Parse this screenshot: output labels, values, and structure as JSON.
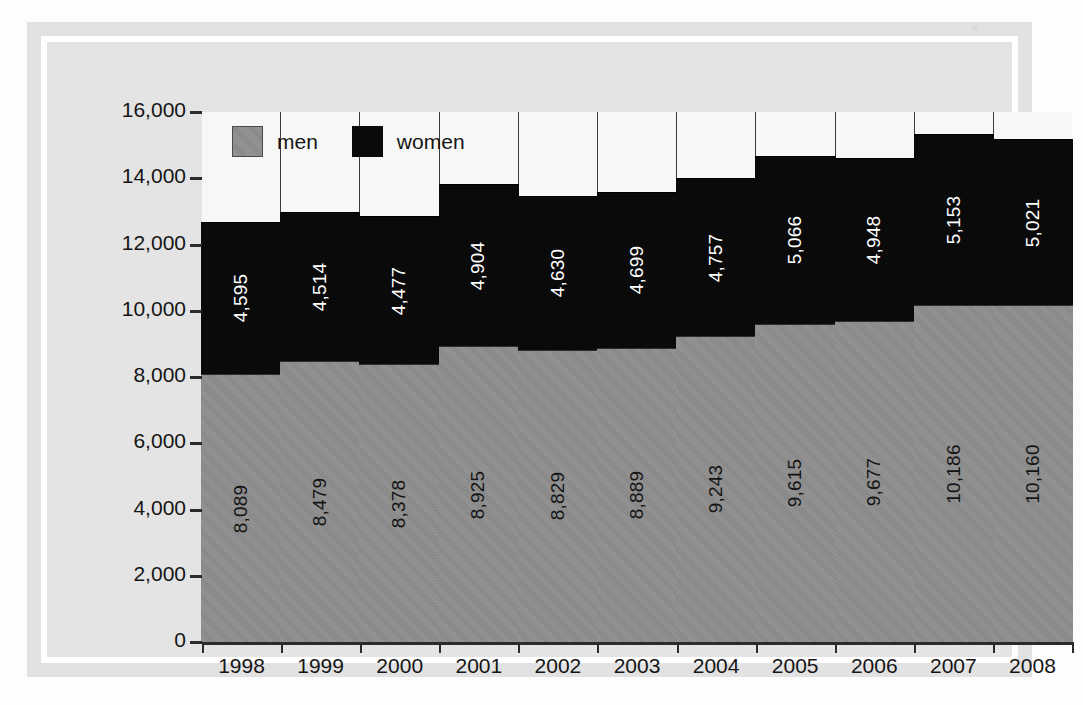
{
  "legend": {
    "position": "inside-top-left",
    "items": [
      {
        "label": "men",
        "color": "#8d8d8d",
        "icon": "square-swatch-icon"
      },
      {
        "label": "women",
        "color": "#0a0a0a",
        "icon": "square-swatch-icon"
      }
    ]
  },
  "yaxis": {
    "ticks": [
      "16,000",
      "14,000",
      "12,000",
      "10,000",
      "8,000",
      "6,000",
      "4,000",
      "2,000",
      "0"
    ]
  },
  "chart_data": {
    "type": "bar",
    "stacked": true,
    "title": "",
    "subtitle": "",
    "xlabel": "",
    "ylabel": "",
    "ylim": [
      0,
      16000
    ],
    "ytick_step": 2000,
    "grid": false,
    "legend_position": "inside-top-left",
    "categories": [
      "1998",
      "1999",
      "2000",
      "2001",
      "2002",
      "2003",
      "2004",
      "2005",
      "2006",
      "2007",
      "2008"
    ],
    "series": [
      {
        "name": "men",
        "color": "#8d8d8d",
        "values": [
          8089,
          8479,
          8378,
          8925,
          8829,
          8889,
          9243,
          9615,
          9677,
          10186,
          10160
        ],
        "labels": [
          "8,089",
          "8,479",
          "8,378",
          "8,925",
          "8,829",
          "8,889",
          "9,243",
          "9,615",
          "9,677",
          "10,186",
          "10,160"
        ]
      },
      {
        "name": "women",
        "color": "#0a0a0a",
        "values": [
          4595,
          4514,
          4477,
          4904,
          4630,
          4699,
          4757,
          5066,
          4948,
          5153,
          5021
        ],
        "labels": [
          "4,595",
          "4,514",
          "4,477",
          "4,904",
          "4,630",
          "4,699",
          "4,757",
          "5,066",
          "4,948",
          "5,153",
          "5,021"
        ]
      }
    ],
    "totals": [
      12684,
      12993,
      12855,
      13829,
      13459,
      13588,
      14000,
      14681,
      14625,
      15339,
      15181
    ]
  }
}
